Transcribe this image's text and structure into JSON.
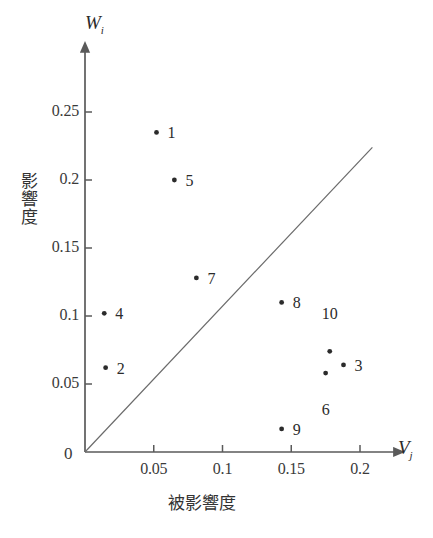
{
  "chart_data": {
    "type": "scatter",
    "title": "",
    "xlabel": "被影響度",
    "ylabel": "影響度",
    "x_axis_symbol": "V",
    "x_axis_subscript": "j",
    "y_axis_symbol": "W",
    "y_axis_subscript": "i",
    "origin_label": "0",
    "xlim": [
      0,
      0.215
    ],
    "ylim": [
      0,
      0.268
    ],
    "x_ticks": [
      0.05,
      0.1,
      0.15,
      0.2
    ],
    "x_tick_labels": [
      "0.05",
      "0.1",
      "0.15",
      "0.2"
    ],
    "y_ticks": [
      0.05,
      0.1,
      0.15,
      0.2,
      0.25
    ],
    "y_tick_labels": [
      "0.05",
      "0.1",
      "0.15",
      "0.2",
      "0.25"
    ],
    "grid": false,
    "legend": "none",
    "reference_line": {
      "name": "y=x diagonal",
      "from": [
        0,
        0
      ],
      "to": [
        0.209,
        0.224
      ]
    },
    "points": [
      {
        "label": "1",
        "x": 0.052,
        "y": 0.235,
        "label_dx": 11,
        "label_dy": -8
      },
      {
        "label": "5",
        "x": 0.065,
        "y": 0.2,
        "label_dx": 11,
        "label_dy": -8
      },
      {
        "label": "7",
        "x": 0.081,
        "y": 0.128,
        "label_dx": 11,
        "label_dy": -8
      },
      {
        "label": "4",
        "x": 0.014,
        "y": 0.102,
        "label_dx": 11,
        "label_dy": -8
      },
      {
        "label": "2",
        "x": 0.015,
        "y": 0.062,
        "label_dx": 11,
        "label_dy": -8
      },
      {
        "label": "8",
        "x": 0.143,
        "y": 0.11,
        "label_dx": 11,
        "label_dy": -8
      },
      {
        "label": "10",
        "x": 0.178,
        "y": 0.074,
        "label_dx": -8,
        "label_dy": -46
      },
      {
        "label": "3",
        "x": 0.188,
        "y": 0.064,
        "label_dx": 11,
        "label_dy": -8
      },
      {
        "label": "6",
        "x": 0.175,
        "y": 0.058,
        "label_dx": -4,
        "label_dy": 28
      },
      {
        "label": "9",
        "x": 0.143,
        "y": 0.017,
        "label_dx": 11,
        "label_dy": -8
      }
    ]
  }
}
